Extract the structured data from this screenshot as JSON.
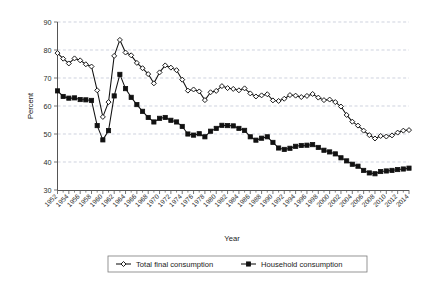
{
  "chart_data": {
    "type": "line",
    "title": "",
    "xlabel": "Year",
    "ylabel": "Percent",
    "ylim": [
      30,
      90
    ],
    "xlim": [
      1952,
      2014
    ],
    "yticks": [
      30,
      40,
      50,
      60,
      70,
      80,
      90
    ],
    "grid": true,
    "legend_position": "bottom",
    "x": [
      1952,
      1953,
      1954,
      1955,
      1956,
      1957,
      1958,
      1959,
      1960,
      1961,
      1962,
      1963,
      1964,
      1965,
      1966,
      1967,
      1968,
      1969,
      1970,
      1971,
      1972,
      1973,
      1974,
      1975,
      1976,
      1977,
      1978,
      1979,
      1980,
      1981,
      1982,
      1983,
      1984,
      1985,
      1986,
      1987,
      1988,
      1989,
      1990,
      1991,
      1992,
      1993,
      1994,
      1995,
      1996,
      1997,
      1998,
      1999,
      2000,
      2001,
      2002,
      2003,
      2004,
      2005,
      2006,
      2007,
      2008,
      2009,
      2010,
      2011,
      2012,
      2013,
      2014
    ],
    "xtick_labels": [
      "1952",
      "1954",
      "1956",
      "1958",
      "1960",
      "1962",
      "1964",
      "1966",
      "1968",
      "1970",
      "1972",
      "1974",
      "1976",
      "1978",
      "1980",
      "1982",
      "1984",
      "1986",
      "1988",
      "1990",
      "1992",
      "1994",
      "1996",
      "1998",
      "2000",
      "2002",
      "2004",
      "2006",
      "2008",
      "2010",
      "2012",
      "2014"
    ],
    "series": [
      {
        "name": "Total final consumption",
        "marker": "open-diamond",
        "values": [
          78.9,
          76.9,
          75.2,
          77.0,
          76.3,
          74.9,
          74.1,
          65.6,
          56.1,
          61.4,
          77.9,
          83.6,
          79.1,
          78.1,
          75.4,
          73.5,
          71.4,
          68.1,
          72.0,
          74.5,
          73.7,
          72.8,
          69.4,
          65.5,
          65.9,
          65.2,
          62.1,
          64.9,
          65.4,
          67.1,
          66.4,
          66.1,
          65.6,
          66.3,
          64.5,
          63.4,
          63.8,
          64.2,
          62.0,
          61.8,
          62.6,
          63.9,
          63.7,
          63.2,
          63.6,
          64.3,
          63.0,
          62.1,
          62.3,
          61.4,
          59.8,
          56.8,
          54.4,
          53.0,
          51.2,
          49.6,
          48.4,
          49.3,
          49.1,
          49.5,
          50.5,
          51.2,
          51.4
        ]
      },
      {
        "name": "Household consumption",
        "marker": "filled-square",
        "values": [
          65.4,
          63.4,
          62.8,
          62.9,
          62.3,
          62.2,
          62.0,
          53.0,
          47.9,
          51.2,
          63.6,
          71.3,
          66.2,
          63.1,
          60.5,
          58.1,
          55.9,
          54.3,
          55.6,
          55.9,
          54.9,
          54.3,
          52.7,
          50.0,
          49.6,
          50.1,
          49.0,
          51.0,
          52.0,
          53.1,
          53.0,
          52.9,
          52.0,
          51.3,
          49.0,
          47.8,
          48.5,
          49.0,
          47.0,
          45.0,
          44.5,
          44.9,
          45.6,
          45.9,
          46.0,
          46.2,
          45.2,
          44.2,
          43.6,
          42.9,
          41.5,
          40.4,
          39.2,
          38.5,
          37.0,
          36.1,
          35.8,
          36.6,
          36.8,
          37.0,
          37.3,
          37.5,
          37.8
        ]
      }
    ]
  },
  "legend": {
    "items": [
      {
        "label": "Total final consumption",
        "marker": "open-diamond"
      },
      {
        "label": "Household consumption",
        "marker": "filled-square"
      }
    ]
  },
  "axes": {
    "y_title": "Percent",
    "x_title": "Year"
  },
  "colors": {
    "series_stroke": "#111111",
    "grid": "#b9bfd0",
    "axis": "#555555",
    "background": "#ffffff"
  }
}
